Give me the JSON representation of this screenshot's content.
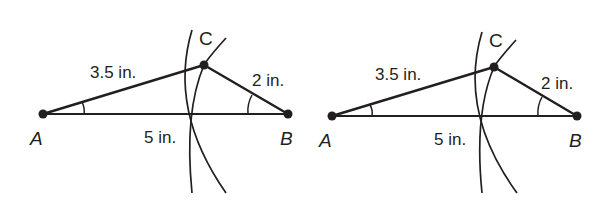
{
  "figures": [
    {
      "id": "left",
      "points": {
        "A": {
          "label": "A",
          "x": 43,
          "y": 114
        },
        "B": {
          "label": "B",
          "x": 288,
          "y": 114
        },
        "C": {
          "label": "C",
          "x": 204,
          "y": 65
        }
      },
      "lengths": {
        "AC": "3.5 in.",
        "CB": "2 in.",
        "AB": "5 in."
      }
    },
    {
      "id": "right",
      "points": {
        "A": {
          "label": "A",
          "x": 332,
          "y": 116
        },
        "B": {
          "label": "B",
          "x": 577,
          "y": 116
        },
        "C": {
          "label": "C",
          "x": 494,
          "y": 67
        }
      },
      "lengths": {
        "AC": "3.5 in.",
        "CB": "2 in.",
        "AB": "5 in."
      }
    }
  ],
  "colors": {
    "ink": "#231f20",
    "background": "#ffffff"
  }
}
